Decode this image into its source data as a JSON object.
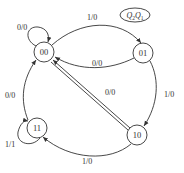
{
  "diagram": {
    "type": "state-diagram",
    "legend": {
      "text": "Q",
      "sub1": "2",
      "text2": "Q",
      "sub2": "1",
      "full": "Q2Q1"
    },
    "states": [
      {
        "id": "s00",
        "label": "00"
      },
      {
        "id": "s01",
        "label": "01"
      },
      {
        "id": "s10",
        "label": "10"
      },
      {
        "id": "s11",
        "label": "11"
      }
    ],
    "transitions": [
      {
        "from": "00",
        "to": "00",
        "label": "0/0"
      },
      {
        "from": "00",
        "to": "01",
        "label": "1/0"
      },
      {
        "from": "01",
        "to": "00",
        "label": "0/0"
      },
      {
        "from": "01",
        "to": "10",
        "label": "1/0"
      },
      {
        "from": "10",
        "to": "00",
        "label": "0/0"
      },
      {
        "from": "10",
        "to": "11",
        "label": "1/0"
      },
      {
        "from": "11",
        "to": "11",
        "label": "1/1"
      },
      {
        "from": "11",
        "to": "00",
        "label": "0/0"
      }
    ],
    "colors": {
      "stroke": "#333333",
      "background": "#ffffff"
    }
  }
}
